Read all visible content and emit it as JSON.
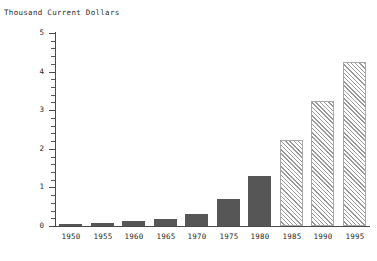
{
  "chart_data": {
    "type": "bar",
    "title": "",
    "ylabel": "Thousand Current Dollars",
    "xlabel": "",
    "categories": [
      "1950",
      "1955",
      "1960",
      "1965",
      "1970",
      "1975",
      "1980",
      "1985",
      "1990",
      "1995"
    ],
    "values": [
      0.05,
      0.08,
      0.14,
      0.17,
      0.32,
      0.7,
      1.3,
      2.23,
      3.25,
      4.25
    ],
    "bar_styles": [
      "solid",
      "solid",
      "solid",
      "solid",
      "solid",
      "solid",
      "solid",
      "hatched",
      "hatched",
      "hatched"
    ],
    "ylim": [
      0,
      5
    ],
    "y_ticks": [
      "0",
      "1",
      "2",
      "3",
      "4",
      "5"
    ],
    "y_tick_values": [
      0,
      1,
      2,
      3,
      4,
      5
    ],
    "y_minor_tick_step": 0.2,
    "grid": false,
    "legend": null,
    "colors": {
      "bar_solid": "#565656",
      "bar_hatch_line": "#9a9a9a",
      "bar_hatch_border": "#a8a8a8",
      "axis": "#4a4a4a",
      "text": "#2b2b2b",
      "background": "#ffffff"
    }
  }
}
